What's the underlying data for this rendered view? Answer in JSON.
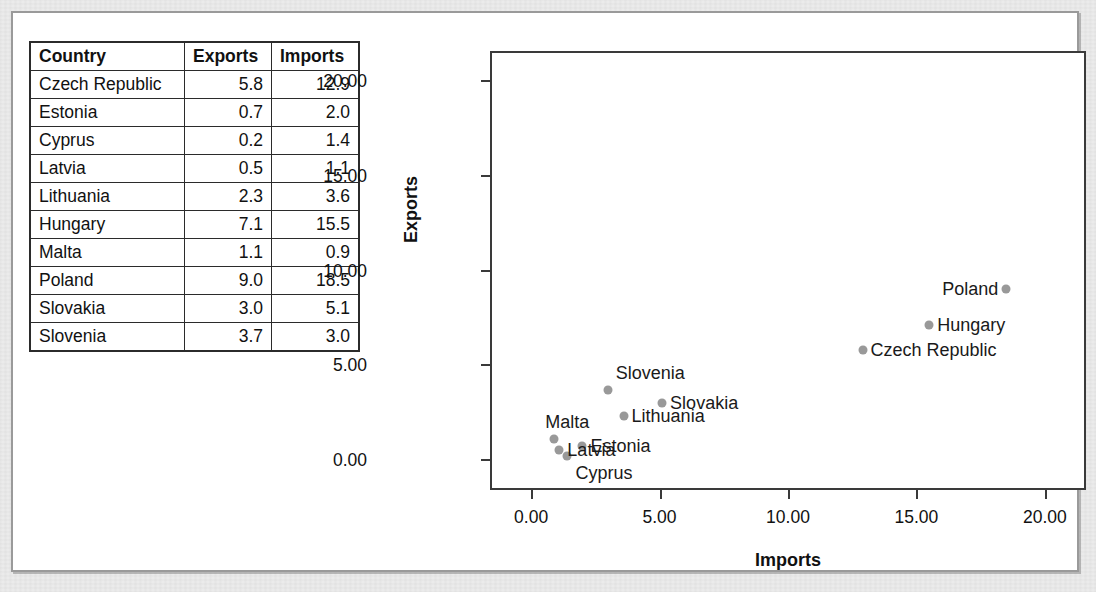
{
  "table": {
    "headers": [
      "Country",
      "Exports",
      "Imports"
    ],
    "rows": [
      {
        "country": "Czech Republic",
        "exports": "5.8",
        "imports": "12.9"
      },
      {
        "country": "Estonia",
        "exports": "0.7",
        "imports": "2.0"
      },
      {
        "country": "Cyprus",
        "exports": "0.2",
        "imports": "1.4"
      },
      {
        "country": "Latvia",
        "exports": "0.5",
        "imports": "1.1"
      },
      {
        "country": "Lithuania",
        "exports": "2.3",
        "imports": "3.6"
      },
      {
        "country": "Hungary",
        "exports": "7.1",
        "imports": "15.5"
      },
      {
        "country": "Malta",
        "exports": "1.1",
        "imports": "0.9"
      },
      {
        "country": "Poland",
        "exports": "9.0",
        "imports": "18.5"
      },
      {
        "country": "Slovakia",
        "exports": "3.0",
        "imports": "5.1"
      },
      {
        "country": "Slovenia",
        "exports": "3.7",
        "imports": "3.0"
      }
    ]
  },
  "chart_data": {
    "type": "scatter",
    "title": "",
    "xlabel": "Imports",
    "ylabel": "Exports",
    "xlim": [
      -1.6,
      21.6
    ],
    "ylim": [
      -1.6,
      21.6
    ],
    "xticks": [
      "0.00",
      "5.00",
      "10.00",
      "15.00",
      "20.00"
    ],
    "xtick_values": [
      0,
      5,
      10,
      15,
      20
    ],
    "yticks": [
      "0.00",
      "5.00",
      "10.00",
      "15.00",
      "20.00"
    ],
    "ytick_values": [
      0,
      5,
      10,
      15,
      20
    ],
    "grid": false,
    "legend": "none",
    "marker_color": "#999999",
    "points": [
      {
        "label": "Czech Republic",
        "x": 12.9,
        "y": 5.8,
        "label_side": "right"
      },
      {
        "label": "Estonia",
        "x": 2.0,
        "y": 0.7,
        "label_side": "right"
      },
      {
        "label": "Cyprus",
        "x": 1.4,
        "y": 0.2,
        "label_side": "cyprus-below"
      },
      {
        "label": "Latvia",
        "x": 1.1,
        "y": 0.5,
        "label_side": "right"
      },
      {
        "label": "Lithuania",
        "x": 3.6,
        "y": 2.3,
        "label_side": "right"
      },
      {
        "label": "Hungary",
        "x": 15.5,
        "y": 7.1,
        "label_side": "right"
      },
      {
        "label": "Malta",
        "x": 0.9,
        "y": 1.1,
        "label_side": "malta-above"
      },
      {
        "label": "Poland",
        "x": 18.5,
        "y": 9.0,
        "label_side": "left"
      },
      {
        "label": "Slovakia",
        "x": 5.1,
        "y": 3.0,
        "label_side": "right"
      },
      {
        "label": "Slovenia",
        "x": 3.0,
        "y": 3.7,
        "label_side": "slovenia-above"
      }
    ]
  },
  "colors": {
    "marker": "#999999",
    "axis": "#3a3a3a",
    "border": "#9a9a9a",
    "text": "#111111"
  }
}
